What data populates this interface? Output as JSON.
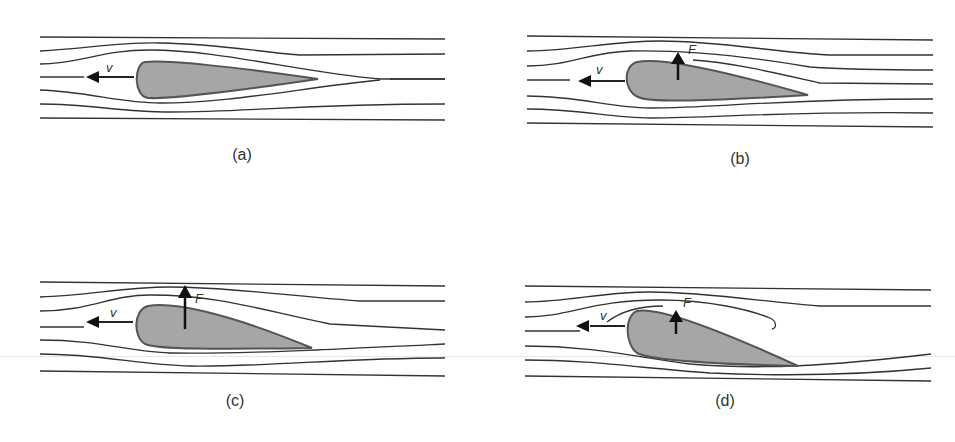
{
  "figure": {
    "colors": {
      "stroke": "#333333",
      "airfoil_fill": "#a6a6a6",
      "airfoil_edge": "#555555",
      "background": "#ffffff"
    },
    "panels": [
      {
        "id": "a",
        "caption": "(a)",
        "velocity_label": "v",
        "force_label": "",
        "has_force_arrow": false,
        "angle_of_attack": "0",
        "description": "Symmetric flow, no lift"
      },
      {
        "id": "b",
        "caption": "(b)",
        "velocity_label": "v",
        "force_label": "F",
        "has_force_arrow": true,
        "angle_of_attack": "small",
        "description": "Cambered airfoil, small upward force"
      },
      {
        "id": "c",
        "caption": "(c)",
        "velocity_label": "v",
        "force_label": "F",
        "has_force_arrow": true,
        "angle_of_attack": "moderate",
        "description": "Larger angle, larger upward force"
      },
      {
        "id": "d",
        "caption": "(d)",
        "velocity_label": "v",
        "force_label": "F",
        "has_force_arrow": true,
        "angle_of_attack": "steep",
        "description": "Steep angle, flow separation, reduced force"
      }
    ]
  }
}
